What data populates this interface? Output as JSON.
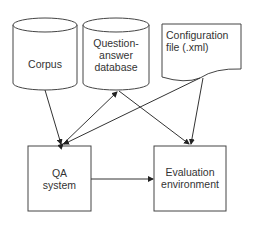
{
  "nodes": {
    "corpus": {
      "label": "Corpus",
      "shape": "cylinder"
    },
    "qa_database": {
      "label_lines": [
        "Question-",
        "answer",
        "database"
      ],
      "shape": "cylinder"
    },
    "config_file": {
      "label_lines": [
        "Configuration",
        "file (.xml)"
      ],
      "shape": "document"
    },
    "qa_system": {
      "label_lines": [
        "QA",
        "system"
      ],
      "shape": "rectangle"
    },
    "evaluation": {
      "label_lines": [
        "Evaluation",
        "environment"
      ],
      "shape": "rectangle"
    }
  },
  "edges": [
    {
      "from": "Corpus",
      "to": "QA system"
    },
    {
      "from": "QA system",
      "to": "Question-answer database",
      "bidirectional": true
    },
    {
      "from": "Configuration file (.xml)",
      "to": "QA system"
    },
    {
      "from": "Question-answer database",
      "to": "Evaluation environment"
    },
    {
      "from": "Configuration file (.xml)",
      "to": "Evaluation environment"
    },
    {
      "from": "QA system",
      "to": "Evaluation environment"
    }
  ],
  "colors": {
    "stroke": "#444444",
    "text": "#333333",
    "background": "#ffffff"
  }
}
